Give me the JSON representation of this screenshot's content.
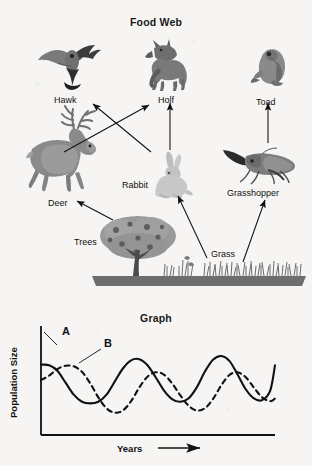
{
  "page": {
    "background_color": "#f6f5f3",
    "ink_color": "#1a1a1a"
  },
  "food_web": {
    "title": "Food Web",
    "nodes": [
      {
        "id": "hawk",
        "label": "Hawk",
        "icon": "hawk-icon",
        "trophic": "tertiary-consumer"
      },
      {
        "id": "wolf",
        "label": "Holf",
        "icon": "wolf-icon",
        "trophic": "tertiary-consumer"
      },
      {
        "id": "toad",
        "label": "Toad",
        "icon": "toad-icon",
        "trophic": "secondary-consumer"
      },
      {
        "id": "deer",
        "label": "Deer",
        "icon": "deer-icon",
        "trophic": "primary-consumer"
      },
      {
        "id": "rabbit",
        "label": "Rabbit",
        "icon": "rabbit-icon",
        "trophic": "primary-consumer"
      },
      {
        "id": "grasshopper",
        "label": "Grasshopper",
        "icon": "grasshopper-icon",
        "trophic": "primary-consumer"
      },
      {
        "id": "trees",
        "label": "Trees",
        "icon": "tree-icon",
        "trophic": "producer"
      },
      {
        "id": "grass",
        "label": "Grass",
        "icon": "grass-icon",
        "trophic": "producer"
      }
    ],
    "arrows": [
      {
        "from": "deer",
        "to": "wolf"
      },
      {
        "from": "rabbit",
        "to": "hawk"
      },
      {
        "from": "rabbit",
        "to": "wolf"
      },
      {
        "from": "grasshopper",
        "to": "toad"
      },
      {
        "from": "trees",
        "to": "deer"
      },
      {
        "from": "grass",
        "to": "rabbit"
      },
      {
        "from": "grass",
        "to": "grasshopper"
      }
    ]
  },
  "chart_data": {
    "type": "line",
    "title": "Graph",
    "xlabel": "Years",
    "ylabel": "Population Size",
    "xlabel_suffix_icon": "right-arrow-icon",
    "grid": false,
    "legend": "inline-callouts",
    "axis_ticks": {
      "x": [],
      "y": []
    },
    "xlim": [
      0,
      10
    ],
    "ylim": [
      0,
      10
    ],
    "annotations": [
      {
        "text": "A",
        "series": "A",
        "x": 1.15,
        "y": 8.7
      },
      {
        "text": "B",
        "series": "B",
        "x": 3.1,
        "y": 8.0
      }
    ],
    "series": [
      {
        "name": "A",
        "style": "solid",
        "role": "prey",
        "x": [
          0.0,
          0.35,
          0.7,
          1.05,
          1.4,
          1.75,
          2.1,
          2.45,
          2.8,
          3.15,
          3.5,
          3.85,
          4.2,
          4.55,
          4.9,
          5.25,
          5.6,
          5.95,
          6.3,
          6.65,
          7.0,
          7.35,
          7.7,
          8.05,
          8.4,
          8.75,
          9.1,
          9.45,
          9.8,
          10.0
        ],
        "y": [
          6.45,
          6.4,
          5.9,
          4.8,
          3.7,
          3.05,
          2.9,
          3.05,
          3.7,
          4.9,
          6.1,
          6.85,
          6.95,
          6.4,
          5.3,
          4.1,
          3.3,
          3.05,
          3.35,
          4.35,
          5.8,
          6.9,
          7.25,
          6.8,
          5.55,
          4.2,
          3.35,
          3.2,
          4.1,
          6.4
        ]
      },
      {
        "name": "B",
        "style": "dashed",
        "role": "predator",
        "x": [
          0.0,
          0.35,
          0.7,
          1.05,
          1.4,
          1.75,
          2.1,
          2.45,
          2.8,
          3.15,
          3.5,
          3.85,
          4.2,
          4.55,
          4.9,
          5.25,
          5.6,
          5.95,
          6.3,
          6.65,
          7.0,
          7.35,
          7.7,
          8.05,
          8.4,
          8.75,
          9.1,
          9.45,
          9.8,
          10.0
        ],
        "y": [
          5.05,
          5.45,
          6.05,
          6.35,
          6.3,
          5.8,
          4.75,
          3.45,
          2.45,
          2.05,
          2.25,
          3.1,
          4.35,
          5.35,
          5.75,
          5.55,
          4.75,
          3.65,
          2.7,
          2.25,
          2.45,
          3.3,
          4.55,
          5.5,
          5.75,
          5.3,
          4.35,
          3.45,
          3.1,
          3.35
        ]
      }
    ]
  }
}
